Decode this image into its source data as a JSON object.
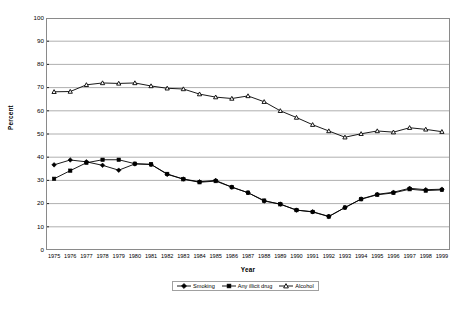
{
  "chart_data": {
    "type": "line",
    "title": "",
    "xlabel": "Year",
    "ylabel": "Percent",
    "ylim": [
      0,
      100
    ],
    "ytick_step": 10,
    "yticks": [
      100,
      90,
      80,
      70,
      60,
      50,
      40,
      30,
      20,
      10,
      0
    ],
    "grid": true,
    "grid_axis": "y",
    "legend_position": "bottom-center",
    "categories": [
      "1975",
      "1976",
      "1977",
      "1978",
      "1979",
      "1980",
      "1981",
      "1982",
      "1983",
      "1984",
      "1985",
      "1986",
      "1987",
      "1988",
      "1989",
      "1990",
      "1991",
      "1992",
      "1993",
      "1994",
      "1995",
      "1996",
      "1997",
      "1998",
      "1999"
    ],
    "series": [
      {
        "name": "Smoking",
        "marker": "diamond",
        "color": "#000000",
        "values": [
          36.7,
          38.8,
          38.0,
          36.5,
          34.4,
          37.1,
          36.9,
          32.6,
          30.6,
          29.4,
          30.0,
          27.1,
          24.7,
          21.1,
          19.8,
          17.2,
          16.5,
          14.5,
          18.3,
          22.0,
          24.0,
          24.9,
          26.6,
          26.0,
          26.2
        ]
      },
      {
        "name": "Any illicit drug",
        "marker": "square",
        "color": "#000000",
        "values": [
          30.7,
          34.2,
          37.6,
          38.9,
          38.9,
          37.2,
          36.9,
          32.8,
          30.5,
          29.2,
          29.7,
          27.1,
          24.7,
          21.3,
          19.7,
          17.2,
          16.4,
          14.4,
          18.3,
          21.9,
          23.8,
          24.6,
          26.2,
          25.6,
          25.9
        ]
      },
      {
        "name": "Alcohol",
        "marker": "triangle",
        "color": "#000000",
        "values": [
          68.2,
          68.3,
          71.2,
          72.0,
          71.8,
          72.0,
          70.7,
          69.7,
          69.4,
          67.2,
          65.9,
          65.3,
          66.4,
          63.9,
          60.0,
          57.1,
          54.0,
          51.3,
          48.6,
          50.1,
          51.3,
          50.8,
          52.7,
          52.0,
          51.0
        ]
      }
    ],
    "smoking_values_plotted": [
      36.7,
      38.8,
      38.0,
      36.5,
      34.4,
      37.1,
      36.9,
      32.6,
      30.6,
      29.4,
      30.0,
      27.1,
      24.7,
      21.1,
      19.8,
      17.2,
      16.5,
      14.5,
      18.3,
      22.0,
      24.0,
      24.9,
      26.6,
      26.0,
      26.2
    ]
  },
  "axis": {
    "y_title": "Percent",
    "x_title": "Year"
  },
  "legend": {
    "items": [
      {
        "label": "Smoking",
        "marker": "diamond"
      },
      {
        "label": "Any illicit drug",
        "marker": "square"
      },
      {
        "label": "Alcohol",
        "marker": "triangle"
      }
    ]
  }
}
